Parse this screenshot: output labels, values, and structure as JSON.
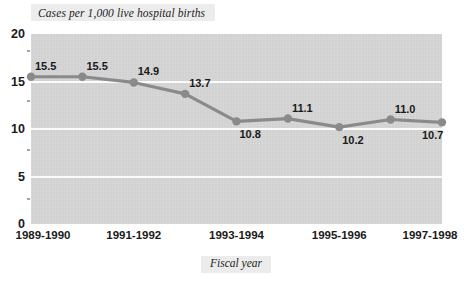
{
  "chart_data": {
    "type": "line",
    "title": "Cases per 1,000 live hospital births",
    "xlabel": "Fiscal year",
    "ylabel": "",
    "ylim": [
      0,
      20
    ],
    "yticks": [
      0,
      5,
      10,
      15,
      20
    ],
    "ytick_labels": [
      "0",
      "5",
      "10",
      "15",
      "20"
    ],
    "grid": true,
    "gridlines_at": [
      5,
      10,
      15
    ],
    "legend": null,
    "x": [
      "1989-1990",
      "1990-1991",
      "1991-1992",
      "1992-1993",
      "1993-1994",
      "1994-1995",
      "1995-1996",
      "1996-1997",
      "1997-1998"
    ],
    "xtick_labels": [
      "1989-1990",
      "1991-1992",
      "1993-1994",
      "1995-1996",
      "1997-1998"
    ],
    "xtick_indices": [
      0,
      2,
      4,
      6,
      8
    ],
    "values": [
      15.5,
      15.5,
      14.9,
      13.7,
      10.8,
      11.1,
      10.2,
      11.0,
      10.7
    ],
    "point_labels": [
      "15.5",
      "15.5",
      "14.9",
      "13.7",
      "10.8",
      "11.1",
      "10.2",
      "11.0",
      "10.7"
    ],
    "label_positions": [
      "above-right",
      "above-right",
      "above-right",
      "above-right",
      "below-right",
      "above-right",
      "below-right",
      "above-right",
      "below-right"
    ],
    "colors": {
      "line": "#8a8a8a",
      "marker": "#8a8a8a",
      "plot_background": "#d5d5d5",
      "gridline": "#fbfbfb",
      "text": "#1a1a1a",
      "title_background": "#ececed",
      "page_background": "#ffffff"
    }
  }
}
